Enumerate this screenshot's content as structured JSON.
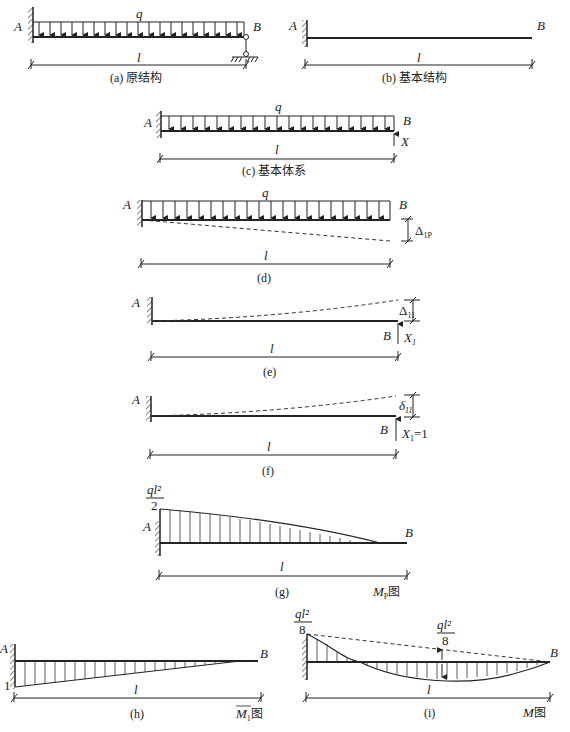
{
  "figures": {
    "a": {
      "caption": "(a) 原结构",
      "A": "A",
      "B": "B",
      "load": "q",
      "span": "l"
    },
    "b": {
      "caption": "(b) 基本结构",
      "A": "A",
      "B": "B",
      "span": "l"
    },
    "c": {
      "caption": "(c) 基本体系",
      "A": "A",
      "B": "B",
      "load": "q",
      "span": "l",
      "force": "X"
    },
    "d": {
      "caption": "(d)",
      "A": "A",
      "B": "B",
      "load": "q",
      "span": "l",
      "disp_symbol": "Δ",
      "disp_sub": "1P"
    },
    "e": {
      "caption": "(e)",
      "A": "A",
      "B": "B",
      "span": "l",
      "disp_symbol": "Δ",
      "disp_sub": "11",
      "force": "X",
      "force_sub": "1"
    },
    "f": {
      "caption": "(f)",
      "A": "A",
      "B": "B",
      "span": "l",
      "disp_symbol": "δ",
      "disp_sub": "11",
      "force": "X",
      "force_sub": "1",
      "force_val": "=1"
    },
    "g": {
      "caption": "(g)",
      "A": "A",
      "B": "B",
      "span": "l",
      "value_num": "ql²",
      "value_den": "2",
      "diagram_name": "M",
      "diagram_sub": "P",
      "diagram_suffix": "图"
    },
    "h": {
      "caption": "(h)",
      "A": "A",
      "B": "B",
      "span": "l",
      "value": "1",
      "diagram_name": "M",
      "diagram_sub": "1",
      "diagram_suffix": "图"
    },
    "i": {
      "caption": "(i)",
      "B": "B",
      "span": "l",
      "value_num": "ql²",
      "value_den": "8",
      "mid_num": "ql²",
      "mid_den": "8",
      "diagram_name": "M",
      "diagram_suffix": "图"
    }
  }
}
